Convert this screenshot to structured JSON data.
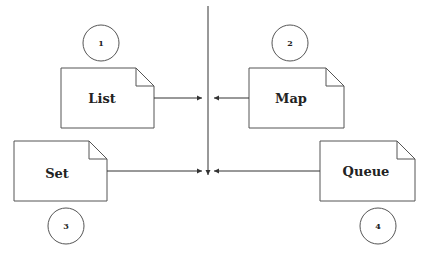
{
  "diagram": {
    "nodes": [
      {
        "id": "list",
        "label": "List",
        "number": "1"
      },
      {
        "id": "map",
        "label": "Map",
        "number": "2"
      },
      {
        "id": "set",
        "label": "Set",
        "number": "3"
      },
      {
        "id": "queue",
        "label": "Queue",
        "number": "4"
      }
    ],
    "edges": [
      {
        "from": "list",
        "to": "center-line-upper"
      },
      {
        "from": "map",
        "to": "center-line-upper"
      },
      {
        "from": "set",
        "to": "center-point"
      },
      {
        "from": "queue",
        "to": "center-point"
      },
      {
        "from": "top",
        "to": "center-point"
      }
    ]
  }
}
